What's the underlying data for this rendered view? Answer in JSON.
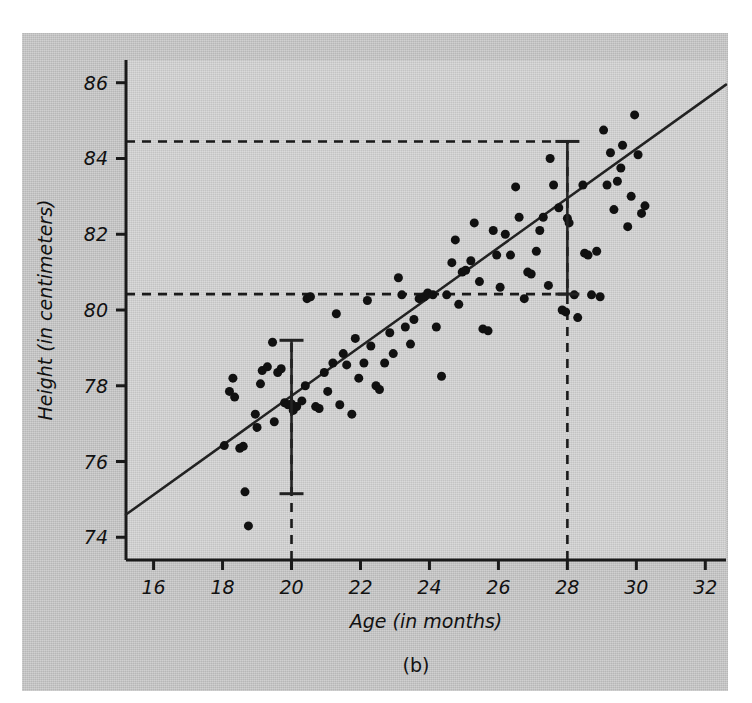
{
  "figure": {
    "caption": "(b)",
    "background_color": "#c9c9c9",
    "plot_background_color": "#d2d2d2",
    "ink_color": "#1a1a1a"
  },
  "chart_data": {
    "type": "scatter",
    "title": "",
    "xlabel": "Age (in months)",
    "ylabel": "Height (in centimeters)",
    "xlim": [
      15.2,
      32.6
    ],
    "ylim": [
      73.4,
      86.6
    ],
    "xticks": [
      16,
      18,
      20,
      22,
      24,
      26,
      28,
      30,
      32
    ],
    "xtick_labels": [
      "16",
      "18",
      "20",
      "22",
      "24",
      "26",
      "28",
      "30",
      "32"
    ],
    "yticks": [
      74,
      76,
      78,
      80,
      82,
      84,
      86
    ],
    "ytick_labels": [
      "74",
      "76",
      "78",
      "80",
      "82",
      "84",
      "86"
    ],
    "grid": false,
    "legend": null,
    "marker": {
      "shape": "circle",
      "color": "#111111",
      "size": 9
    },
    "regression_line": {
      "label": "least-squares line",
      "color": "#222222",
      "width": 2.5,
      "x_start": 15.2,
      "y_start": 74.6,
      "x_end": 32.6,
      "y_end": 85.95,
      "slope": 0.652,
      "intercept": 64.69
    },
    "error_bars": [
      {
        "name": "prediction-interval-at-20",
        "x": 20,
        "center": 77.52,
        "lower": 75.15,
        "upper": 79.2,
        "cap_width": 12,
        "color": "#222222"
      },
      {
        "name": "prediction-interval-at-28",
        "x": 28,
        "center": 82.42,
        "lower": 80.42,
        "upper": 84.45,
        "cap_width": 12,
        "color": "#222222"
      }
    ],
    "guide_lines": [
      {
        "name": "vertical-guide-20",
        "orientation": "vertical",
        "value": 20,
        "from": 73.4,
        "to": 79.2,
        "style": "dashed"
      },
      {
        "name": "vertical-guide-28",
        "orientation": "vertical",
        "value": 28,
        "from": 73.4,
        "to": 84.45,
        "style": "dashed"
      },
      {
        "name": "horizontal-guide-8445",
        "orientation": "horizontal",
        "value": 84.45,
        "from": 15.2,
        "to": 28,
        "style": "dashed"
      },
      {
        "name": "horizontal-guide-8042",
        "orientation": "horizontal",
        "value": 80.42,
        "from": 15.2,
        "to": 28,
        "style": "dashed"
      }
    ],
    "points": [
      [
        18.05,
        76.42
      ],
      [
        18.2,
        77.85
      ],
      [
        18.3,
        78.2
      ],
      [
        18.35,
        77.7
      ],
      [
        18.5,
        76.35
      ],
      [
        18.6,
        76.4
      ],
      [
        18.65,
        75.2
      ],
      [
        18.75,
        74.3
      ],
      [
        18.95,
        77.25
      ],
      [
        19.0,
        76.9
      ],
      [
        19.1,
        78.05
      ],
      [
        19.15,
        78.4
      ],
      [
        19.3,
        78.5
      ],
      [
        19.45,
        79.15
      ],
      [
        19.5,
        77.05
      ],
      [
        19.6,
        78.35
      ],
      [
        19.7,
        78.45
      ],
      [
        19.8,
        77.55
      ],
      [
        19.9,
        77.5
      ],
      [
        20.0,
        77.52
      ],
      [
        20.05,
        77.35
      ],
      [
        20.15,
        77.45
      ],
      [
        20.3,
        77.6
      ],
      [
        20.4,
        78.0
      ],
      [
        20.45,
        80.3
      ],
      [
        20.55,
        80.35
      ],
      [
        20.7,
        77.45
      ],
      [
        20.8,
        77.4
      ],
      [
        20.95,
        78.35
      ],
      [
        21.05,
        77.85
      ],
      [
        21.2,
        78.6
      ],
      [
        21.3,
        79.9
      ],
      [
        21.4,
        77.5
      ],
      [
        21.5,
        78.85
      ],
      [
        21.6,
        78.55
      ],
      [
        21.75,
        77.25
      ],
      [
        21.85,
        79.25
      ],
      [
        21.95,
        78.2
      ],
      [
        22.1,
        78.6
      ],
      [
        22.2,
        80.25
      ],
      [
        22.3,
        79.05
      ],
      [
        22.45,
        78.0
      ],
      [
        22.55,
        77.9
      ],
      [
        22.7,
        78.6
      ],
      [
        22.85,
        79.4
      ],
      [
        22.95,
        78.85
      ],
      [
        23.1,
        80.85
      ],
      [
        23.2,
        80.4
      ],
      [
        23.3,
        79.55
      ],
      [
        23.45,
        79.1
      ],
      [
        23.55,
        79.75
      ],
      [
        23.7,
        80.3
      ],
      [
        23.85,
        80.35
      ],
      [
        23.95,
        80.45
      ],
      [
        24.1,
        80.4
      ],
      [
        24.2,
        79.55
      ],
      [
        24.35,
        78.25
      ],
      [
        24.5,
        80.4
      ],
      [
        24.65,
        81.25
      ],
      [
        24.75,
        81.85
      ],
      [
        24.85,
        80.15
      ],
      [
        24.95,
        81.0
      ],
      [
        25.05,
        81.05
      ],
      [
        25.2,
        81.3
      ],
      [
        25.3,
        82.3
      ],
      [
        25.45,
        80.75
      ],
      [
        25.55,
        79.5
      ],
      [
        25.7,
        79.45
      ],
      [
        25.85,
        82.1
      ],
      [
        25.95,
        81.45
      ],
      [
        26.05,
        80.6
      ],
      [
        26.2,
        82.0
      ],
      [
        26.35,
        81.45
      ],
      [
        26.5,
        83.25
      ],
      [
        26.6,
        82.45
      ],
      [
        26.75,
        80.3
      ],
      [
        26.85,
        81.0
      ],
      [
        26.95,
        80.95
      ],
      [
        27.1,
        81.55
      ],
      [
        27.2,
        82.1
      ],
      [
        27.3,
        82.45
      ],
      [
        27.45,
        80.65
      ],
      [
        27.5,
        84.0
      ],
      [
        27.6,
        83.3
      ],
      [
        27.75,
        82.7
      ],
      [
        27.85,
        80.0
      ],
      [
        27.95,
        79.95
      ],
      [
        28.0,
        82.42
      ],
      [
        28.05,
        82.3
      ],
      [
        28.2,
        80.4
      ],
      [
        28.3,
        79.8
      ],
      [
        28.45,
        83.3
      ],
      [
        28.5,
        81.5
      ],
      [
        28.6,
        81.45
      ],
      [
        28.7,
        80.4
      ],
      [
        28.85,
        81.55
      ],
      [
        28.95,
        80.35
      ],
      [
        29.05,
        84.75
      ],
      [
        29.15,
        83.3
      ],
      [
        29.25,
        84.15
      ],
      [
        29.35,
        82.65
      ],
      [
        29.45,
        83.4
      ],
      [
        29.55,
        83.75
      ],
      [
        29.6,
        84.35
      ],
      [
        29.75,
        82.2
      ],
      [
        29.85,
        83.0
      ],
      [
        29.95,
        85.15
      ],
      [
        30.05,
        84.1
      ],
      [
        30.15,
        82.55
      ],
      [
        30.25,
        82.75
      ]
    ]
  }
}
